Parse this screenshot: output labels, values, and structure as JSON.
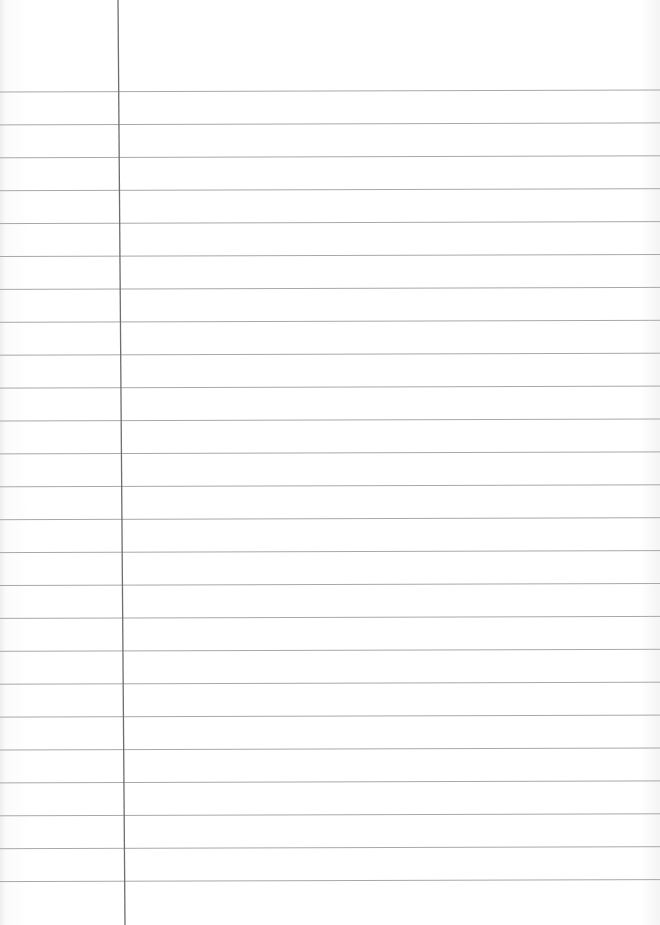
{
  "document": {
    "type": "lined-paper",
    "content_text": "",
    "colors": {
      "paper": "#ffffff",
      "rule_line": "#a8a8a8",
      "margin_line": "#6e6e6e"
    },
    "rules": {
      "count": 25,
      "first_y_left": 92,
      "first_y_right": 90,
      "spacing": 32.9
    },
    "margin": {
      "x_top": 118,
      "x_bottom": 125
    }
  }
}
